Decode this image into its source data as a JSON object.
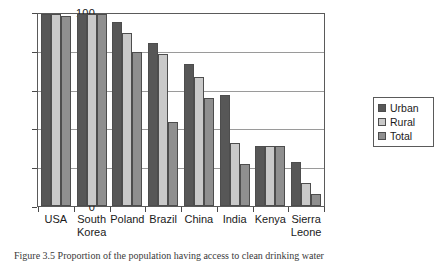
{
  "chart_data": {
    "type": "bar",
    "title": "",
    "xlabel": "",
    "ylabel": "",
    "ylim": [
      0,
      100
    ],
    "yticks": [
      0,
      20,
      40,
      60,
      80,
      100
    ],
    "grid": true,
    "legend_position": "right",
    "categories": [
      "USA",
      "South Korea",
      "Poland",
      "Brazil",
      "China",
      "India",
      "Kenya",
      "Sierra Leone"
    ],
    "series": [
      {
        "name": "Urban",
        "color": "#575757",
        "values": [
          100,
          100,
          96,
          85,
          74,
          58,
          31,
          23
        ]
      },
      {
        "name": "Rural",
        "color": "#c9c9c9",
        "values": [
          100,
          100,
          90,
          79,
          67,
          33,
          31,
          12
        ]
      },
      {
        "name": "Total",
        "color": "#8f8f8f",
        "values": [
          99,
          100,
          80,
          44,
          56,
          22,
          31,
          6
        ]
      }
    ]
  },
  "axis": {
    "y_tick_labels": [
      "0",
      "20",
      "40",
      "60",
      "80",
      "100"
    ]
  },
  "legend": {
    "items": [
      {
        "label": "Urban",
        "swatch": "urban"
      },
      {
        "label": "Rural",
        "swatch": "rural"
      },
      {
        "label": "Total",
        "swatch": "total"
      }
    ]
  },
  "caption": {
    "text": "Figure 3.5 Proportion of the population having access to clean drinking water"
  }
}
